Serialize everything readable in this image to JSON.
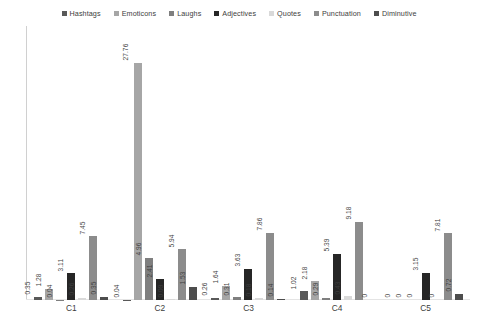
{
  "chart_data": {
    "type": "bar",
    "title": "",
    "xlabel": "",
    "ylabel": "",
    "ylim": [
      0,
      29
    ],
    "grid": false,
    "legend_position": "top-center",
    "categories": [
      "C1",
      "C2",
      "C3",
      "C4",
      "C5"
    ],
    "series": [
      {
        "name": "Hashtags",
        "color": "#595959",
        "values": [
          0.35,
          0.04,
          0.26,
          1.02,
          0
        ]
      },
      {
        "name": "Emoticons",
        "color": "#a6a6a6",
        "values": [
          1.28,
          27.76,
          1.64,
          2.18,
          0
        ]
      },
      {
        "name": "Laughs",
        "color": "#7f7f7f",
        "values": [
          0.04,
          4.96,
          0.31,
          0.29,
          0
        ]
      },
      {
        "name": "Adjectives",
        "color": "#262626",
        "values": [
          3.11,
          2.41,
          3.63,
          5.39,
          3.15
        ]
      },
      {
        "name": "Quotes",
        "color": "#d9d9d9",
        "values": [
          0.26,
          0.09,
          0.18,
          0.43,
          0
        ]
      },
      {
        "name": "Punctuation",
        "color": "#8c8c8c",
        "values": [
          7.45,
          5.94,
          7.86,
          9.18,
          7.81
        ]
      },
      {
        "name": "Diminutive",
        "color": "#4d4d4d",
        "values": [
          0.35,
          1.53,
          0.14,
          0,
          0.72
        ]
      }
    ],
    "value_labels": [
      [
        "0.35",
        "1.28",
        "0.04",
        "3.11",
        "0.26",
        "7.45",
        "0.35"
      ],
      [
        "0.04",
        "27.76",
        "4.96",
        "2.41",
        "0.09",
        "5.94",
        "1.53"
      ],
      [
        "0.26",
        "1.64",
        "0.31",
        "3.63",
        "0.18",
        "7.86",
        "0.14"
      ],
      [
        "1.02",
        "2.18",
        "0.29",
        "5.39",
        "0.43",
        "9.18",
        "0"
      ],
      [
        "0",
        "0",
        "0",
        "3.15",
        "0",
        "7.81",
        "0.72"
      ]
    ]
  },
  "legend": {
    "items": [
      {
        "label": "Hashtags"
      },
      {
        "label": "Emoticons"
      },
      {
        "label": "Laughs"
      },
      {
        "label": "Adjectives"
      },
      {
        "label": "Quotes"
      },
      {
        "label": "Punctuation"
      },
      {
        "label": "Diminutive"
      }
    ]
  }
}
